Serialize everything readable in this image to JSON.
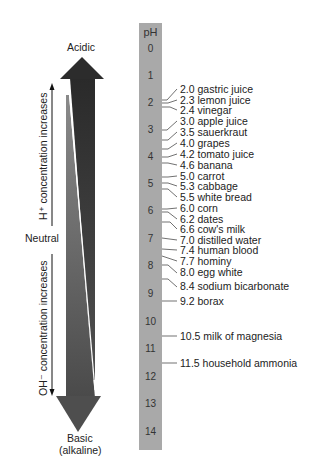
{
  "bar": {
    "header": "pH",
    "ticks": [
      "0",
      "1",
      "2",
      "3",
      "4",
      "5",
      "6",
      "7",
      "8",
      "9",
      "10",
      "11",
      "12",
      "13",
      "14"
    ]
  },
  "labels": {
    "acidic": "Acidic",
    "neutral": "Neutral",
    "basic": "Basic",
    "alkaline": "(alkaline)",
    "h_increase": "H⁺ concentration increases",
    "oh_increase": "OH⁻ concentration increases"
  },
  "substances": [
    {
      "ph": "2.0",
      "name": "gastric juice"
    },
    {
      "ph": "2.3",
      "name": "lemon juice"
    },
    {
      "ph": "2.4",
      "name": "vinegar"
    },
    {
      "ph": "3.0",
      "name": "apple juice"
    },
    {
      "ph": "3.5",
      "name": "sauerkraut"
    },
    {
      "ph": "4.0",
      "name": "grapes"
    },
    {
      "ph": "4.2",
      "name": "tomato juice"
    },
    {
      "ph": "4.6",
      "name": "banana"
    },
    {
      "ph": "5.0",
      "name": "carrot"
    },
    {
      "ph": "5.3",
      "name": "cabbage"
    },
    {
      "ph": "5.5",
      "name": "white bread"
    },
    {
      "ph": "6.0",
      "name": "corn"
    },
    {
      "ph": "6.2",
      "name": "dates"
    },
    {
      "ph": "6.6",
      "name": "cow's milk"
    },
    {
      "ph": "7.0",
      "name": "distilled water"
    },
    {
      "ph": "7.4",
      "name": "human blood"
    },
    {
      "ph": "7.7",
      "name": "hominy"
    },
    {
      "ph": "8.0",
      "name": "egg white"
    },
    {
      "ph": "8.4",
      "name": "sodium bicarbonate"
    },
    {
      "ph": "9.2",
      "name": "borax"
    },
    {
      "ph": "10.5",
      "name": "milk of magnesia"
    },
    {
      "ph": "11.5",
      "name": "household ammonia"
    }
  ],
  "colors": {
    "bar": "#a9a9a9",
    "acid_arrow": "#2e2e2e",
    "base_arrow": "#5a5a5a"
  }
}
